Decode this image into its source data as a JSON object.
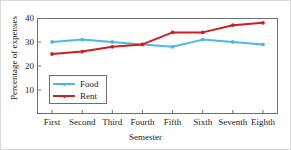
{
  "chart_data": {
    "type": "line",
    "title": "",
    "xlabel": "Semester",
    "ylabel": "Percentage of expenses",
    "categories": [
      "First",
      "Second",
      "Third",
      "Fourth",
      "Fifth",
      "Sixth",
      "Seventh",
      "Eighth"
    ],
    "series": [
      {
        "name": "Food",
        "color": "#4DB8E8",
        "values": [
          30,
          31,
          30,
          29,
          28,
          31,
          30,
          29
        ]
      },
      {
        "name": "Rent",
        "color": "#CC2020",
        "values": [
          25,
          26,
          28,
          29,
          34,
          34,
          37,
          38
        ]
      }
    ],
    "ylim": [
      0,
      40
    ],
    "y_ticks": [
      10,
      20,
      30,
      40
    ],
    "grid": false,
    "legend_position": "inside-lower-left"
  }
}
